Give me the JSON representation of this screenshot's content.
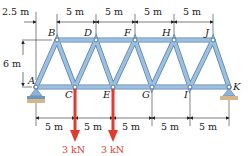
{
  "diagram": {
    "type": "truss",
    "nodes": {
      "top": [
        "B",
        "D",
        "F",
        "H",
        "J"
      ],
      "bottom": [
        "A",
        "C",
        "E",
        "G",
        "I",
        "K"
      ]
    },
    "dimensions": {
      "offset_left": "2.5 m",
      "top_spacing": [
        "5 m",
        "5 m",
        "5 m",
        "5 m"
      ],
      "height": "6 m",
      "bottom_spacing": [
        "5 m",
        "5 m",
        "5 m",
        "5 m",
        "5 m"
      ]
    },
    "loads": [
      {
        "node": "C",
        "label": "3 kN"
      },
      {
        "node": "E",
        "label": "3 kN"
      }
    ],
    "supports": {
      "A": "pin",
      "K": "roller"
    },
    "colors": {
      "member": "#8fb3d6",
      "member_edge": "#5b84ad",
      "load": "#e23a2e",
      "support_base": "#d9b58a"
    }
  }
}
